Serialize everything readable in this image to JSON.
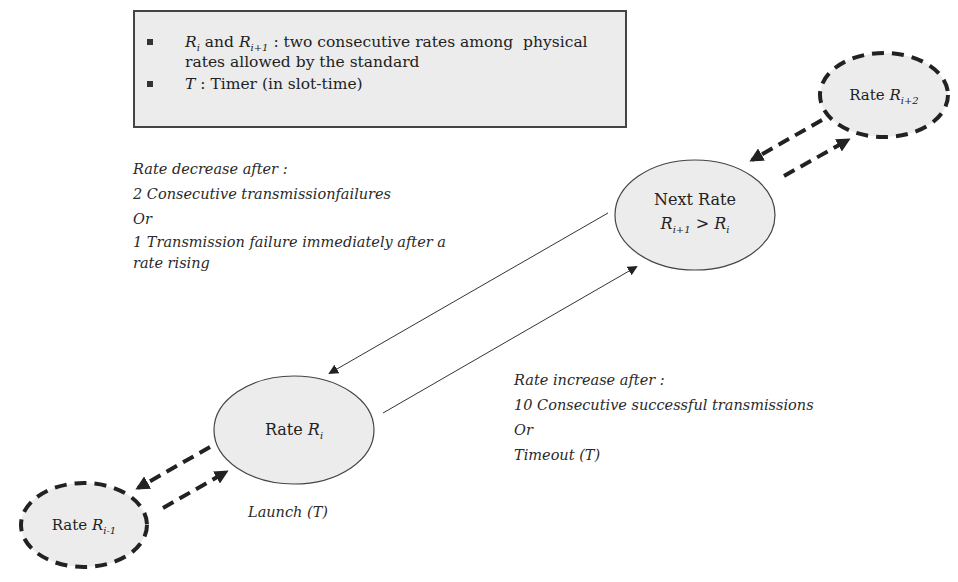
{
  "legend": {
    "items": [
      {
        "line1_var_a": "R",
        "line1_sub_a": "i",
        "line1_mid": " and ",
        "line1_var_b": "R",
        "line1_sub_b": "i+1",
        "line1_rest": " : two consecutive rates among  physical",
        "line2": "rates allowed by the standard"
      },
      {
        "var": "T",
        "rest": " : Timer (in slot-time)"
      }
    ]
  },
  "decrease_note": {
    "title": "Rate decrease after :",
    "line1": "2 Consecutive transmissionfailures",
    "or": "Or",
    "line2": "1 Transmission failure immediately after a",
    "line3": "rate rising"
  },
  "increase_note": {
    "title": "Rate increase after :",
    "line1": "10 Consecutive successful transmissions",
    "or": "Or",
    "line2": "Timeout (T)"
  },
  "nodes": {
    "current": {
      "prefix": "Rate ",
      "var": "R",
      "sub": "i"
    },
    "next": {
      "title": "Next Rate",
      "var_a": "R",
      "sub_a": "i+1",
      "op": " > ",
      "var_b": "R",
      "sub_b": "i"
    },
    "prev": {
      "prefix": "Rate ",
      "var": "R",
      "sub": "i-1"
    },
    "next2": {
      "prefix": "Rate ",
      "var": "R",
      "sub": "i+2"
    }
  },
  "launch_label": "Launch (T)",
  "colors": {
    "node_fill": "#ececec",
    "stroke": "#333333",
    "dashed_stroke": "#222222"
  }
}
